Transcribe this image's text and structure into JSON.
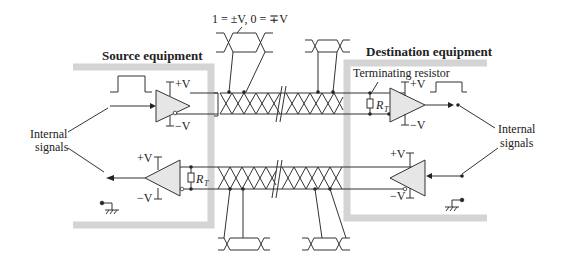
{
  "diagram": {
    "labels": {
      "source_equipment": "Source equipment",
      "destination_equipment": "Destination equipment",
      "logic_levels": "1 = ±V, 0 = ∓V",
      "terminating_resistor": "Terminating resistor",
      "internal_signals_left": "Internal",
      "internal_signals_left_2": "signals",
      "internal_signals_right": "Internal",
      "internal_signals_right_2": "signals",
      "plus_v": "+V",
      "minus_v": "−V",
      "rt_r": "R",
      "rt_sub": "T"
    },
    "components": [
      {
        "name": "source-driver",
        "type": "amplifier",
        "direction": "right"
      },
      {
        "name": "destination-receiver",
        "type": "amplifier",
        "direction": "right"
      },
      {
        "name": "destination-driver",
        "type": "amplifier",
        "direction": "left"
      },
      {
        "name": "source-receiver",
        "type": "amplifier",
        "direction": "left"
      },
      {
        "name": "terminating-resistor-destination",
        "type": "resistor",
        "label": "RT"
      },
      {
        "name": "terminating-resistor-source",
        "type": "resistor",
        "label": "RT"
      },
      {
        "name": "twisted-pair-top",
        "type": "twisted-pair cable"
      },
      {
        "name": "twisted-pair-bottom",
        "type": "twisted-pair cable"
      },
      {
        "name": "ground-left",
        "type": "ground"
      },
      {
        "name": "ground-right",
        "type": "ground"
      }
    ],
    "colors": {
      "line": "#333333",
      "equipment_box": "#d4d4d4",
      "amplifier_fill": "#e6e6e6"
    }
  }
}
